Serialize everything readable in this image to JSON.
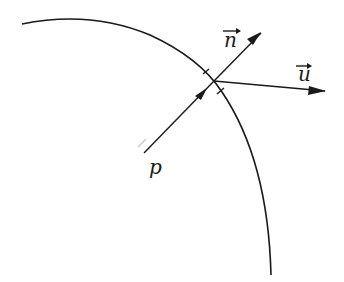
{
  "diagram": {
    "type": "vector-refraction-boundary",
    "surface": {
      "description": "curved boundary arc"
    },
    "point_label": "p",
    "normal_label": "n",
    "direction_label": "u",
    "arrow_symbol": "→"
  }
}
